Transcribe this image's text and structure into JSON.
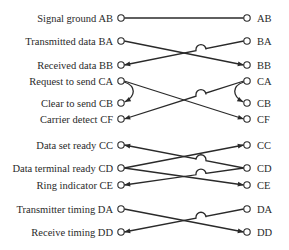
{
  "diagram": {
    "title": "",
    "left_pins": [
      {
        "id": "AB",
        "label": "Signal ground AB"
      },
      {
        "id": "BA",
        "label": "Transmitted data BA"
      },
      {
        "id": "BB",
        "label": "Received data BB"
      },
      {
        "id": "CA",
        "label": "Request to send CA"
      },
      {
        "id": "CB",
        "label": "Clear to send CB"
      },
      {
        "id": "CF",
        "label": "Carrier detect CF"
      },
      {
        "id": "CC",
        "label": "Data set ready CC"
      },
      {
        "id": "CD",
        "label": "Data terminal ready CD"
      },
      {
        "id": "CE",
        "label": "Ring indicator CE"
      },
      {
        "id": "DA",
        "label": "Transmitter timing DA"
      },
      {
        "id": "DD",
        "label": "Receive timing DD"
      }
    ],
    "right_pins": [
      {
        "id": "AB",
        "label": "AB"
      },
      {
        "id": "BA",
        "label": "BA"
      },
      {
        "id": "BB",
        "label": "BB"
      },
      {
        "id": "CA",
        "label": "CA"
      },
      {
        "id": "CB",
        "label": "CB"
      },
      {
        "id": "CF",
        "label": "CF"
      },
      {
        "id": "CC",
        "label": "CC"
      },
      {
        "id": "CD",
        "label": "CD"
      },
      {
        "id": "CE",
        "label": "CE"
      },
      {
        "id": "DA",
        "label": "DA"
      },
      {
        "id": "DD",
        "label": "DD"
      }
    ],
    "connections": [
      {
        "from": "L.AB",
        "to": "R.AB",
        "arrow": "none",
        "hop": false
      },
      {
        "from": "L.BA",
        "to": "R.BB",
        "arrow": "end",
        "hop": false
      },
      {
        "from": "R.BA",
        "to": "L.BB",
        "arrow": "end",
        "hop": true
      },
      {
        "from": "L.CA",
        "to": "L.CB",
        "arrow": "end",
        "loop": true
      },
      {
        "from": "L.CA",
        "to": "R.CF",
        "arrow": "end",
        "hop": false
      },
      {
        "from": "R.CA",
        "to": "R.CB",
        "arrow": "end",
        "loop": true
      },
      {
        "from": "R.CA",
        "to": "L.CF",
        "arrow": "end",
        "hop": true
      },
      {
        "from": "L.CD",
        "to": "R.CC",
        "arrow": "end",
        "hop": false
      },
      {
        "from": "R.CD",
        "to": "L.CC",
        "arrow": "end",
        "hop": true
      },
      {
        "from": "L.CD",
        "to": "R.CE",
        "arrow": "end",
        "hop": false
      },
      {
        "from": "R.CD",
        "to": "L.CE",
        "arrow": "end",
        "hop": true
      },
      {
        "from": "L.DA",
        "to": "R.DD",
        "arrow": "end",
        "hop": false
      },
      {
        "from": "R.DA",
        "to": "L.DD",
        "arrow": "end",
        "hop": true
      }
    ]
  }
}
